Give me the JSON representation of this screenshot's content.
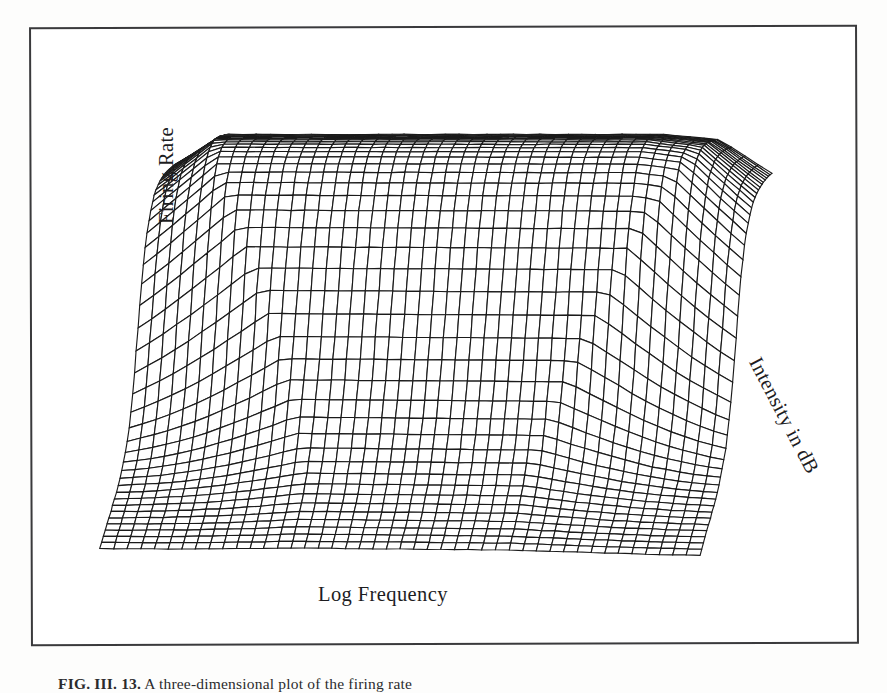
{
  "figure": {
    "axis_labels": {
      "vertical": "Firing Rate",
      "horizontal": "Log Frequency",
      "depth": "Intensity in dB"
    },
    "caption_label": "FIG. III. 13.",
    "caption_text": "  A three-dimensional plot of the firing rate"
  },
  "chart_data": {
    "type": "surface",
    "title": "",
    "xlabel": "Log Frequency",
    "ylabel": "Firing Rate",
    "zlabel": "Intensity in dB",
    "grid": true,
    "legend": "none",
    "axis_ticks": {
      "x": [],
      "y": [],
      "z": []
    },
    "mesh": {
      "x_divisions": 44,
      "z_divisions": 42,
      "line_color": "#1a1a1a",
      "face_color": "#ffffff",
      "hidden_line_removal": true
    },
    "projection": {
      "type": "oblique-parallel",
      "corners_px": {
        "front_left": [
          100,
          566
        ],
        "front_right": [
          700,
          572
        ],
        "back_right": [
          772,
          306
        ],
        "back_left": [
          176,
          300
        ]
      },
      "plateau_top_px": 128
    },
    "xlim": [
      0,
      1
    ],
    "ylim": [
      0,
      1
    ],
    "zlim": [
      0,
      1
    ],
    "surface_model": {
      "form": "saturating sigmoid in intensity, gaussian-modulated in log frequency",
      "threshold_z": 0.46,
      "slope": 11.0,
      "tuning_center_x": 0.5,
      "tuning_width": 0.34,
      "spontaneous_rate": 0.04,
      "saturated_rate": 1.0
    }
  }
}
